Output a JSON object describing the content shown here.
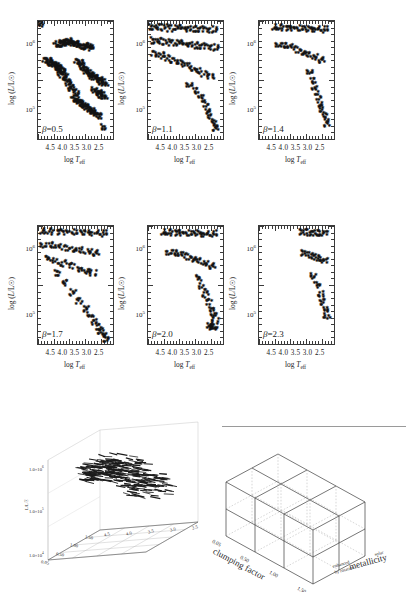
{
  "figure": {
    "type": "multi-panel-scientific-figure",
    "axis": {
      "xlabel_prefix": "log",
      "xlabel_symbol": "T",
      "xlabel_sub": "eff",
      "ylabel": "log (L/L☉)",
      "xticks": [
        "4.5",
        "4.0",
        "3.5",
        "3.0",
        "2.5"
      ],
      "xlim": [
        4.75,
        2.35
      ],
      "yticks": [
        "10",
        "10"
      ],
      "ytick_exponents": [
        "6",
        "5"
      ],
      "ylim_log": [
        4.55,
        6.35
      ]
    },
    "panels": [
      {
        "id": "panel-beta-0.5",
        "label_symbol": "β",
        "label_value": "=0.5",
        "beta": 0.5
      },
      {
        "id": "panel-beta-1.1",
        "label_symbol": "β",
        "label_value": "=1.1",
        "beta": 1.1
      },
      {
        "id": "panel-beta-1.4",
        "label_symbol": "β",
        "label_value": "=1.4",
        "beta": 1.4
      },
      {
        "id": "panel-beta-1.7",
        "label_symbol": "β",
        "label_value": "=1.7",
        "beta": 1.7
      },
      {
        "id": "panel-beta-2.0",
        "label_symbol": "β",
        "label_value": "=2.0",
        "beta": 2.0
      },
      {
        "id": "panel-beta-2.3",
        "label_symbol": "β",
        "label_value": "=2.3",
        "beta": 2.3
      }
    ]
  },
  "chart_data": {
    "type": "scatter",
    "title": "",
    "xlabel": "log T_eff",
    "ylabel": "log (L/L_sun)",
    "xlim": [
      4.75,
      2.35
    ],
    "ylim": [
      4.55,
      6.35
    ],
    "xticks": [
      4.5,
      4.0,
      3.5,
      3.0,
      2.5
    ],
    "yticks": [
      5,
      6
    ],
    "ytick_labels": [
      "10^5",
      "10^6"
    ],
    "xaxis_inverted": true,
    "yaxis_scale": "log",
    "grid": false,
    "legend": "none",
    "marker": "asterisk",
    "marker_color": "#111111",
    "panels": [
      {
        "name": "beta=0.5",
        "annotation": "β=0.5",
        "series": [
          {
            "name": "track-1",
            "x": [
              4.62
            ],
            "y": [
              6.28
            ]
          },
          {
            "name": "track-2",
            "x": [
              4.12,
              4.05,
              3.98,
              3.92,
              3.86,
              3.8,
              3.74,
              3.68,
              3.62,
              3.56,
              3.5,
              3.44,
              3.38,
              3.32
            ],
            "y": [
              5.96,
              5.97,
              5.98,
              5.99,
              5.99,
              6.0,
              6.0,
              6.0,
              5.99,
              5.98,
              5.97,
              5.96,
              5.95,
              5.94
            ]
          },
          {
            "name": "track-3",
            "x": [
              3.18,
              3.12,
              3.06,
              3.0
            ],
            "y": [
              5.92,
              5.93,
              5.94,
              5.92
            ]
          },
          {
            "name": "track-4",
            "x": [
              4.46,
              4.4,
              4.34,
              4.28,
              4.22,
              4.16,
              4.1,
              4.04,
              3.98,
              3.92
            ],
            "y": [
              5.72,
              5.71,
              5.7,
              5.68,
              5.66,
              5.64,
              5.62,
              5.6,
              5.58,
              5.56
            ]
          },
          {
            "name": "track-5",
            "x": [
              4.1,
              4.04,
              3.98,
              3.92,
              3.86,
              3.8,
              3.74,
              3.68,
              3.62,
              3.56,
              3.5
            ],
            "y": [
              5.62,
              5.58,
              5.54,
              5.5,
              5.46,
              5.42,
              5.38,
              5.34,
              5.3,
              5.26,
              5.22
            ]
          },
          {
            "name": "track-6",
            "x": [
              3.44,
              3.38,
              3.32,
              3.26,
              3.2,
              3.14,
              3.08,
              3.02,
              2.96,
              2.9
            ],
            "y": [
              5.7,
              5.68,
              5.66,
              5.62,
              5.58,
              5.54,
              5.52,
              5.5,
              5.48,
              5.46
            ]
          },
          {
            "name": "track-7",
            "x": [
              2.88,
              2.82,
              2.76,
              2.7,
              2.64,
              2.58
            ],
            "y": [
              5.46,
              5.44,
              5.42,
              5.4,
              5.38,
              5.36
            ]
          },
          {
            "name": "track-8",
            "x": [
              3.56,
              3.5,
              3.44,
              3.38,
              3.32,
              3.26,
              3.2,
              3.14,
              3.08,
              3.02,
              2.96,
              2.9,
              2.84,
              2.78
            ],
            "y": [
              5.14,
              5.12,
              5.1,
              5.08,
              5.06,
              5.04,
              5.02,
              5.0,
              4.98,
              4.96,
              4.94,
              4.92,
              4.9,
              4.88
            ]
          },
          {
            "name": "track-9",
            "x": [
              2.9,
              2.84,
              2.78,
              2.72,
              2.66,
              2.6
            ],
            "y": [
              5.26,
              5.24,
              5.22,
              5.2,
              5.18,
              5.16
            ]
          },
          {
            "name": "track-10",
            "x": [
              2.62
            ],
            "y": [
              4.7
            ]
          }
        ]
      },
      {
        "name": "beta=1.1",
        "annotation": "β=1.1",
        "series": [
          {
            "name": "upper-band",
            "x": [
              4.6,
              4.4,
              4.2,
              4.0,
              3.8,
              3.6,
              3.4,
              3.2,
              3.0,
              2.8,
              2.6
            ],
            "y": [
              6.22,
              6.22,
              6.22,
              6.21,
              6.21,
              6.21,
              6.2,
              6.2,
              6.2,
              6.19,
              6.19
            ]
          },
          {
            "name": "second-band",
            "x": [
              4.55,
              4.35,
              4.15,
              3.95,
              3.75,
              3.55,
              3.35,
              3.15,
              2.95,
              2.75,
              2.55
            ],
            "y": [
              6.02,
              6.01,
              6.0,
              5.99,
              5.98,
              5.97,
              5.96,
              5.95,
              5.94,
              5.93,
              5.92
            ]
          },
          {
            "name": "third-band",
            "x": [
              4.5,
              4.3,
              4.1,
              3.9,
              3.7,
              3.5,
              3.3,
              3.1,
              2.9,
              2.7
            ],
            "y": [
              5.82,
              5.79,
              5.76,
              5.72,
              5.68,
              5.64,
              5.6,
              5.56,
              5.52,
              5.48
            ]
          },
          {
            "name": "lower-cloud",
            "x": [
              3.4,
              3.2,
              3.0,
              2.9,
              2.8,
              2.7,
              2.6,
              2.55
            ],
            "y": [
              5.35,
              5.25,
              5.15,
              5.05,
              4.95,
              4.85,
              4.75,
              4.68
            ]
          }
        ]
      },
      {
        "name": "beta=1.4",
        "annotation": "β=1.4",
        "series": [
          {
            "name": "upper-band",
            "x": [
              4.2,
              4.0,
              3.8,
              3.6,
              3.4,
              3.2,
              3.0,
              2.8,
              2.6
            ],
            "y": [
              6.22,
              6.22,
              6.21,
              6.21,
              6.21,
              6.2,
              6.2,
              6.2,
              6.19
            ]
          },
          {
            "name": "mid-band",
            "x": [
              4.1,
              3.9,
              3.7,
              3.5,
              3.3,
              3.1,
              2.9,
              2.7
            ],
            "y": [
              5.96,
              5.94,
              5.92,
              5.88,
              5.84,
              5.8,
              5.76,
              5.72
            ]
          },
          {
            "name": "cloud",
            "x": [
              3.1,
              3.0,
              2.92,
              2.84,
              2.76,
              2.68,
              2.6,
              2.54
            ],
            "y": [
              5.55,
              5.4,
              5.28,
              5.16,
              5.05,
              4.95,
              4.85,
              4.75
            ]
          }
        ]
      },
      {
        "name": "beta=1.7",
        "annotation": "β=1.7",
        "series": [
          {
            "name": "top-band",
            "x": [
              4.55,
              4.3,
              4.05,
              3.8,
              3.55,
              3.3,
              3.05,
              2.8,
              2.6
            ],
            "y": [
              6.24,
              6.24,
              6.23,
              6.23,
              6.23,
              6.22,
              6.22,
              6.22,
              6.21
            ]
          },
          {
            "name": "second-band",
            "x": [
              4.55,
              4.3,
              4.05,
              3.8,
              3.55,
              3.3,
              3.05,
              2.85
            ],
            "y": [
              6.03,
              6.02,
              6.0,
              5.98,
              5.96,
              5.94,
              5.92,
              5.9
            ]
          },
          {
            "name": "third-band",
            "x": [
              4.4,
              4.15,
              3.9,
              3.65,
              3.4,
              3.15,
              2.95
            ],
            "y": [
              5.82,
              5.79,
              5.75,
              5.71,
              5.67,
              5.63,
              5.6
            ]
          },
          {
            "name": "dense-cloud",
            "x": [
              4.1,
              3.85,
              3.6,
              3.4,
              3.2,
              3.05,
              2.9,
              2.78,
              2.68,
              2.6,
              2.55
            ],
            "y": [
              5.6,
              5.45,
              5.3,
              5.18,
              5.05,
              4.95,
              4.86,
              4.78,
              4.72,
              4.66,
              4.6
            ]
          }
        ]
      },
      {
        "name": "beta=2.0",
        "annotation": "β=2.0",
        "series": [
          {
            "name": "top-band",
            "x": [
              4.2,
              4.0,
              3.8,
              3.6,
              3.4,
              3.2,
              3.0,
              2.8,
              2.6
            ],
            "y": [
              6.22,
              6.22,
              6.22,
              6.21,
              6.21,
              6.21,
              6.2,
              6.2,
              6.2
            ]
          },
          {
            "name": "mid-band",
            "x": [
              4.05,
              3.85,
              3.65,
              3.45,
              3.25,
              3.05,
              2.85,
              2.65
            ],
            "y": [
              5.92,
              5.9,
              5.88,
              5.85,
              5.82,
              5.78,
              5.74,
              5.7
            ]
          },
          {
            "name": "cloud",
            "x": [
              3.1,
              2.98,
              2.88,
              2.78,
              2.7,
              2.62,
              2.56
            ],
            "y": [
              5.52,
              5.4,
              5.28,
              5.16,
              5.06,
              4.96,
              4.88
            ]
          },
          {
            "name": "low-clump",
            "x": [
              2.74,
              2.66,
              2.6
            ],
            "y": [
              4.8,
              4.78,
              4.77
            ]
          }
        ]
      },
      {
        "name": "beta=2.3",
        "annotation": "β=2.3",
        "series": [
          {
            "name": "top-band",
            "x": [
              3.35,
              3.15,
              2.95,
              2.78,
              2.62
            ],
            "y": [
              6.22,
              6.22,
              6.21,
              6.21,
              6.21
            ]
          },
          {
            "name": "mid-band",
            "x": [
              3.3,
              3.1,
              2.92,
              2.76,
              2.62
            ],
            "y": [
              5.9,
              5.88,
              5.85,
              5.82,
              5.79
            ]
          },
          {
            "name": "cloud",
            "x": [
              2.96,
              2.86,
              2.76,
              2.68,
              2.6,
              2.55
            ],
            "y": [
              5.55,
              5.42,
              5.28,
              5.16,
              5.04,
              4.94
            ]
          }
        ]
      }
    ]
  },
  "plot3d": {
    "name": "3d-scatter-luminosity",
    "ylabel": "L/L☉",
    "ytick_labels": [
      "1.0×10",
      "1.0×10",
      "1.0×10"
    ],
    "ytick_exponents": [
      "6",
      "5",
      "4"
    ],
    "xtick_labels": [
      "4.5",
      "4.0",
      "3.5",
      "3.0",
      "2.5"
    ],
    "ztick_labels": [
      "0.05",
      "0.50",
      "1.00",
      "1.50"
    ],
    "xlabel": "log T",
    "xlabel_sub": "eff",
    "zlabel": "clumping factor"
  },
  "cube": {
    "name": "parameter-space-cube",
    "axis_clumping": "clumping factor",
    "axis_metallicity": "metallicity",
    "clumping_ticks": [
      "0.05",
      "0.50",
      "1.00",
      "1.50"
    ],
    "metallicity_left": "enhanced",
    "metallicity_left2": "by rotation",
    "metallicity_right": "solar",
    "grid_cols": 3,
    "grid_rows": 2,
    "grid_depth": 2
  }
}
